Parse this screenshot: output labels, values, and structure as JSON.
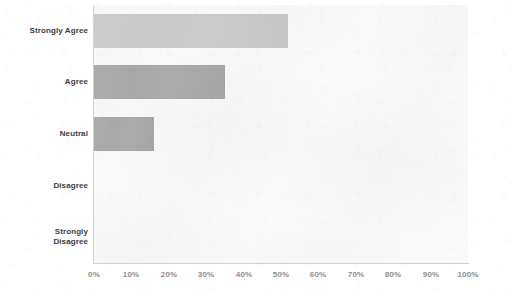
{
  "chart_data": {
    "type": "bar",
    "orientation": "horizontal",
    "title": "",
    "subtitle": "",
    "xlabel": "",
    "ylabel": "",
    "categories": [
      "Strongly Agree",
      "Agree",
      "Neutral",
      "Disagree",
      "Strongly\nDisagree"
    ],
    "values": [
      52,
      35,
      16,
      0,
      0
    ],
    "value_unit": "%",
    "xlim": [
      0,
      100
    ],
    "xtick_labels": [
      "0%",
      "10%",
      "20%",
      "30%",
      "40%",
      "50%",
      "60%",
      "70%",
      "80%",
      "90%",
      "100%"
    ],
    "xtick_values": [
      0,
      10,
      20,
      30,
      40,
      50,
      60,
      70,
      80,
      90,
      100
    ],
    "grid": false,
    "legend": null,
    "annotations": [],
    "bar_colors": [
      "#c9c9c9",
      "#a8a8a8",
      "#a8a8a8",
      "#a8a8a8",
      "#a8a8a8"
    ],
    "plot_background": "#fafafa",
    "axis_color": "#d2d2d2",
    "category_label_color": "#3d3d3d",
    "tick_label_color": "#8e8e8e"
  }
}
